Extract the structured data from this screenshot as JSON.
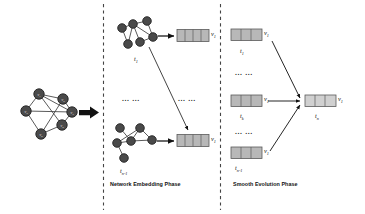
{
  "figure": {
    "title_visible": false,
    "background": "#ffffff",
    "panels": [
      {
        "id": "input-graph",
        "label": "",
        "divider_after": true
      },
      {
        "id": "network-embedding",
        "label": "Network Embedding Phase",
        "divider_after": true
      },
      {
        "id": "smooth-evolution",
        "label": "Smooth Evolution Phase",
        "divider_after": false
      }
    ]
  },
  "colors": {
    "node_fill": "#4a4a4a",
    "node_stroke": "#1f1f1f",
    "edge": "#3d3d3d",
    "vector_fill": "#b8b8b8",
    "vector_fill_light": "#d0d0d0",
    "vector_stroke": "#5a5a5a",
    "arrow": "#111111",
    "divider": "#444444",
    "text": "#111111"
  },
  "input_graph": {
    "name": "input-network",
    "node_labels": [
      "v1",
      "v2",
      "v3",
      "v4",
      "v5",
      "v6"
    ],
    "node_count": 6,
    "edge_count": 9
  },
  "big_arrow": {
    "name": "input-to-embedding-arrow",
    "direction": "right"
  },
  "embedding_phase": {
    "title": "Network Embedding Phase",
    "snapshots": [
      {
        "time_label": "t",
        "time_sub": "1",
        "vector_label": "v",
        "vector_sub": "1",
        "cells": 4,
        "node_count": 6
      },
      {
        "time_label": "t",
        "time_sub": "n-1",
        "vector_label": "v",
        "vector_sub": "1",
        "cells": 4,
        "node_count": 6
      }
    ],
    "ellipsis": [
      "... ...",
      "... ..."
    ]
  },
  "evolution_phase": {
    "title": "Smooth Evolution Phase",
    "inputs": [
      {
        "time_label": "t",
        "time_sub": "1",
        "vector_label": "v",
        "vector_sub": "1",
        "cells": 3
      },
      {
        "time_label": "t",
        "time_sub": "k",
        "vector_label": "v",
        "vector_sub": "1",
        "cells": 3
      },
      {
        "time_label": "t",
        "time_sub": "n-1",
        "vector_label": "v",
        "vector_sub": "1",
        "cells": 3
      }
    ],
    "ellipsis": [
      "... ...",
      "... ..."
    ],
    "output": {
      "time_label": "t",
      "time_sub": "n",
      "vector_label": "v",
      "vector_sub": "1",
      "cells": 3
    }
  }
}
